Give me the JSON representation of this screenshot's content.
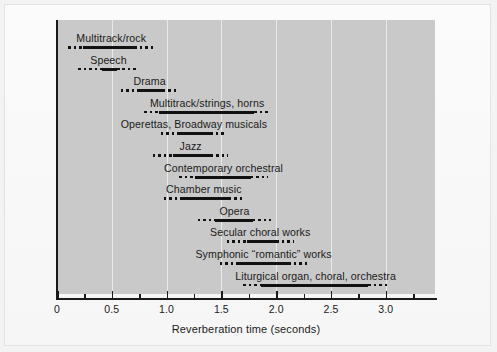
{
  "chart_data": {
    "type": "bar",
    "orientation": "horizontal-range",
    "title": "",
    "xlabel": "Reverberation time (seconds)",
    "ylabel": "",
    "xlim": [
      0,
      3.45
    ],
    "xticks": [
      "0",
      "0.5",
      "1.0",
      "1.5",
      "2.0",
      "2.5",
      "3.0"
    ],
    "xtick_values": [
      0,
      0.5,
      1.0,
      1.5,
      2.0,
      2.5,
      3.0
    ],
    "minor_ticks": [
      0.25,
      0.75,
      1.25,
      1.75,
      2.25,
      2.75,
      3.25
    ],
    "grid": "vertical gridlines at major ticks",
    "legend": "none",
    "categories": [
      "Multitrack/rock",
      "Speech",
      "Drama",
      "Multitrack/strings, horns",
      "Operettas, Broadway musicals",
      "Jazz",
      "Contemporary orchestral",
      "Chamber music",
      "Opera",
      "Secular choral works",
      "Symphonic “romantic” works",
      "Liturgical organ, choral, orchestra"
    ],
    "series": [
      {
        "name": "Multitrack/rock",
        "fade_start": 0.1,
        "core_start": 0.24,
        "core_end": 0.7,
        "fade_end": 0.89
      },
      {
        "name": "Speech",
        "fade_start": 0.19,
        "core_start": 0.41,
        "core_end": 0.55,
        "fade_end": 0.75
      },
      {
        "name": "Drama",
        "fade_start": 0.58,
        "core_start": 0.73,
        "core_end": 0.97,
        "fade_end": 1.11
      },
      {
        "name": "Multitrack/strings, horns",
        "fade_start": 0.79,
        "core_start": 0.93,
        "core_end": 1.8,
        "fade_end": 1.95
      },
      {
        "name": "Operettas, Broadway musicals",
        "fade_start": 0.95,
        "core_start": 1.11,
        "core_end": 1.4,
        "fade_end": 1.55
      },
      {
        "name": "Jazz",
        "fade_start": 0.88,
        "core_start": 1.06,
        "core_end": 1.41,
        "fade_end": 1.56
      },
      {
        "name": "Contemporary orchestral",
        "fade_start": 1.11,
        "core_start": 1.26,
        "core_end": 1.77,
        "fade_end": 1.93
      },
      {
        "name": "Chamber music",
        "fade_start": 0.98,
        "core_start": 1.13,
        "core_end": 1.57,
        "fade_end": 1.7
      },
      {
        "name": "Opera",
        "fade_start": 1.29,
        "core_start": 1.44,
        "core_end": 1.79,
        "fade_end": 1.95
      },
      {
        "name": "Secular choral works",
        "fade_start": 1.55,
        "core_start": 1.73,
        "core_end": 2.0,
        "fade_end": 2.16
      },
      {
        "name": "Symphonic “romantic” works",
        "fade_start": 1.49,
        "core_start": 1.66,
        "core_end": 2.11,
        "fade_end": 2.28
      },
      {
        "name": "Liturgical organ, choral, orchestra",
        "fade_start": 1.7,
        "core_start": 1.86,
        "core_end": 2.84,
        "fade_end": 3.02
      }
    ]
  },
  "colors": {
    "plot_background": "#c9c9c9",
    "page_background": "#f6f6f6",
    "bar": "#111111",
    "axis": "#1a1a1a",
    "gridline": "#e9e9e9"
  },
  "axis": {
    "xlabel": "Reverberation time (seconds)",
    "tick_labels": [
      "0",
      "0.5",
      "1.0",
      "1.5",
      "2.0",
      "2.5",
      "3.0"
    ]
  }
}
